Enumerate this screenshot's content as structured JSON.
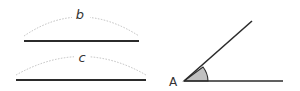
{
  "diagram": {
    "segment_b": {
      "label": "b"
    },
    "segment_c": {
      "label": "c"
    },
    "angle": {
      "vertex_label": "A"
    }
  },
  "colors": {
    "line": "#2b2b2b",
    "arc": "#b8b8b8",
    "wedge_fill": "#c0c0c0",
    "background": "#ffffff"
  }
}
